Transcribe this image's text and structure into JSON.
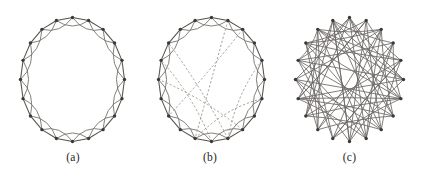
{
  "figure": {
    "panels": [
      {
        "id": "a",
        "caption": "(a)",
        "name": "regular-ring-lattice",
        "node_count": 20,
        "description": "Regular ring lattice: each node joined to its 2 nearest neighbours on each side",
        "center": [
          72.5,
          79.5
        ],
        "radius_x": 52,
        "radius_y": 62,
        "start_angle_deg": -90,
        "ring_links": [
          1
        ],
        "arc_links": [
          2
        ],
        "rewired_links": []
      },
      {
        "id": "b",
        "caption": "(b)",
        "name": "small-world-network",
        "node_count": 20,
        "description": "Small-world network: a few edges rewired at random, shown dashed",
        "center": [
          71.5,
          79.5
        ],
        "radius_x": 53,
        "radius_y": 62,
        "start_angle_deg": -90,
        "ring_links": [
          1
        ],
        "arc_links": [
          2
        ],
        "rewired_links": [
          [
            1,
            11
          ],
          [
            2,
            13
          ],
          [
            4,
            9
          ],
          [
            8,
            15
          ],
          [
            9,
            17
          ],
          [
            10,
            16
          ],
          [
            11,
            6
          ]
        ]
      },
      {
        "id": "c",
        "caption": "(c)",
        "name": "random-network",
        "node_count": 20,
        "description": "Random network: every edge rewired at random",
        "center": [
          72.5,
          79.5
        ],
        "radius_x": 54,
        "radius_y": 62,
        "start_angle_deg": -90,
        "ring_links": [],
        "arc_links": [],
        "random_links": [
          [
            0,
            5
          ],
          [
            0,
            9
          ],
          [
            0,
            13
          ],
          [
            0,
            16
          ],
          [
            1,
            4
          ],
          [
            1,
            10
          ],
          [
            1,
            14
          ],
          [
            1,
            17
          ],
          [
            2,
            7
          ],
          [
            2,
            11
          ],
          [
            2,
            15
          ],
          [
            2,
            18
          ],
          [
            3,
            6
          ],
          [
            3,
            12
          ],
          [
            3,
            16
          ],
          [
            3,
            19
          ],
          [
            4,
            8
          ],
          [
            4,
            13
          ],
          [
            4,
            17
          ],
          [
            5,
            10
          ],
          [
            5,
            14
          ],
          [
            5,
            18
          ],
          [
            6,
            11
          ],
          [
            6,
            15
          ],
          [
            6,
            0
          ],
          [
            7,
            12
          ],
          [
            7,
            16
          ],
          [
            7,
            19
          ],
          [
            8,
            13
          ],
          [
            8,
            17
          ],
          [
            8,
            1
          ],
          [
            9,
            14
          ],
          [
            9,
            18
          ],
          [
            9,
            3
          ],
          [
            10,
            15
          ],
          [
            10,
            19
          ],
          [
            11,
            16
          ],
          [
            11,
            4
          ],
          [
            12,
            17
          ],
          [
            12,
            2
          ],
          [
            13,
            18
          ],
          [
            13,
            6
          ],
          [
            14,
            19
          ],
          [
            14,
            7
          ],
          [
            15,
            0
          ],
          [
            15,
            8
          ],
          [
            16,
            5
          ],
          [
            16,
            9
          ],
          [
            17,
            2
          ],
          [
            17,
            11
          ],
          [
            18,
            6
          ],
          [
            18,
            12
          ],
          [
            19,
            5
          ],
          [
            19,
            13
          ],
          [
            0,
            7
          ],
          [
            2,
            9
          ],
          [
            4,
            11
          ],
          [
            6,
            14
          ],
          [
            8,
            19
          ],
          [
            10,
            3
          ],
          [
            12,
            15
          ],
          [
            14,
            1
          ],
          [
            16,
            18
          ],
          [
            18,
            4
          ],
          [
            19,
            10
          ],
          [
            17,
            6
          ]
        ]
      }
    ]
  },
  "style": {
    "background_color": "#ffffff",
    "node_color": "#3b3a38",
    "ring_edge_color": "#55524f",
    "arc_edge_color": "#6e6a66",
    "rewire_edge_color": "#9a8f86",
    "random_edge_color": "#6b6764",
    "caption_color": "#262626",
    "node_radius": 1.7
  }
}
